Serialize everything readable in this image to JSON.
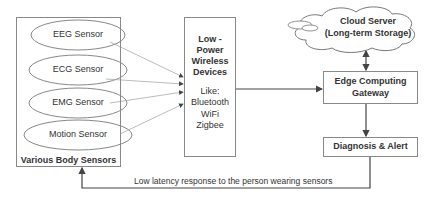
{
  "sensors": {
    "group_label": "Various Body Sensors",
    "items": [
      {
        "label": "EEG Sensor"
      },
      {
        "label": "ECG Sensor"
      },
      {
        "label": "EMG Sensor"
      },
      {
        "label": "Motion Sensor"
      }
    ]
  },
  "wireless": {
    "title_lines": [
      "Low -",
      "Power",
      "Wireless",
      "Devices"
    ],
    "examples_lines": [
      "Like:",
      "Bluetooth",
      "WiFi",
      "Zigbee"
    ]
  },
  "cloud": {
    "line1": "Cloud Server",
    "line2": "(Long-term Storage)"
  },
  "gateway": {
    "line1": "Edge Computing",
    "line2": "Gateway"
  },
  "diagnosis": {
    "label": "Diagnosis & Alert"
  },
  "feedback": {
    "label": "Low latency response to the person wearing sensors"
  }
}
